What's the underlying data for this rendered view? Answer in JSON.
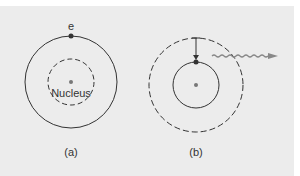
{
  "diagram": {
    "panel_a": {
      "electron_label": "e",
      "nucleus_label": "Nucleus",
      "caption": "(a)"
    },
    "panel_b": {
      "caption": "(b)"
    },
    "colors": {
      "background": "#ececec",
      "line": "#333333",
      "nucleus": "#777777",
      "photon": "#888888"
    }
  }
}
